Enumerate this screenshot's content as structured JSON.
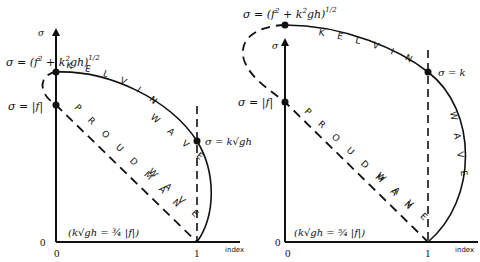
{
  "figure": {
    "panels": [
      {
        "id": "left",
        "y_axis_label": "σ",
        "x_axis_label": "index",
        "x_ticks": [
          "0",
          "1"
        ],
        "y_ticks": [
          "0"
        ],
        "top_point_label": "σ = (f² + k²gh)^1/2",
        "top_point_label_main": "σ = (f",
        "top_point_label_sup1": "2",
        "top_point_label_mid": " + k",
        "top_point_label_sup2": "2",
        "top_point_label_end": "gh)",
        "top_point_label_sup3": "1/2",
        "f_point_label": "σ = |f|",
        "kgh_point_label": "σ = k√gh",
        "kelvin_label": "K E L V I N",
        "kelvin_label_2": "W A V E",
        "proudman_label": "P R O U D M A N",
        "proudman_label_2": "W A V E",
        "condition": "(k√gh = ¾ |f|)",
        "condition_ratio": "3/4"
      },
      {
        "id": "right",
        "y_axis_label": "σ",
        "x_axis_label": "index",
        "x_ticks": [
          "0",
          "1"
        ],
        "y_ticks": [
          "0"
        ],
        "top_point_label_main": "σ = (f",
        "top_point_label_sup1": "2",
        "top_point_label_mid": " + k",
        "top_point_label_sup2": "2",
        "top_point_label_end": "gh)",
        "top_point_label_sup3": "1/2",
        "f_point_label": "σ = |f|",
        "kgh_point_label": "σ = k",
        "kelvin_label": "K E L V I N",
        "kelvin_label_2": "W A V E",
        "proudman_label": "P R O U D M A N",
        "proudman_label_2": "W A V E",
        "condition": "(k√gh = ⁵⁄₄ |f|)",
        "condition_ratio": "5/4"
      }
    ],
    "colors": {
      "ink": "#111111",
      "background": "#ffffff"
    }
  }
}
